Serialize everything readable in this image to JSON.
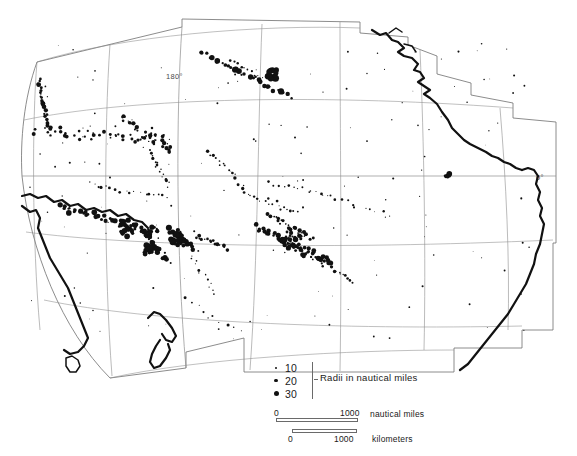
{
  "map": {
    "title": "Pacific Ocean islands map",
    "projection_note": "interrupted stepped graticule",
    "labels": [
      {
        "name": "meridian-180",
        "text": "180°",
        "x": 168,
        "y": 76
      },
      {
        "name": "equator-0",
        "text": "0°",
        "x": 536,
        "y": 178
      }
    ],
    "colors": {
      "land": "#111111",
      "graticule": "#8d8d8d",
      "border": "#6f6f6f",
      "background": "#ffffff"
    }
  },
  "legend": {
    "caption": "Radii in nautical miles",
    "items": [
      {
        "label": "10",
        "size_class": "d10"
      },
      {
        "label": "20",
        "size_class": "d20"
      },
      {
        "label": "30",
        "size_class": "d30"
      }
    ]
  },
  "scales": {
    "nautical": {
      "zero": "0",
      "max": "1000",
      "unit": "nautical miles"
    },
    "kilometers": {
      "zero": "0",
      "max": "1000",
      "unit": "kilometers"
    }
  },
  "chart_data": {
    "type": "scatter",
    "xlabel": "longitude",
    "ylabel": "latitude",
    "legend_position": "bottom-left",
    "size_legend": [
      10,
      20,
      30
    ],
    "size_units": "nautical miles",
    "clusters": [
      {
        "name": "Mariana Islands",
        "cx": 44,
        "cy": 95
      },
      {
        "name": "Caroline Islands",
        "cx": 95,
        "cy": 133
      },
      {
        "name": "Marshall Islands",
        "cx": 150,
        "cy": 128
      },
      {
        "name": "Hawaiian Islands",
        "cx": 270,
        "cy": 75
      },
      {
        "name": "New Guinea",
        "cx": 70,
        "cy": 215
      },
      {
        "name": "Solomon Islands",
        "cx": 120,
        "cy": 225
      },
      {
        "name": "Vanuatu",
        "cx": 150,
        "cy": 245
      },
      {
        "name": "Fiji",
        "cx": 175,
        "cy": 240
      },
      {
        "name": "Samoa-Tonga",
        "cx": 205,
        "cy": 245
      },
      {
        "name": "Society Islands",
        "cx": 280,
        "cy": 240
      },
      {
        "name": "Tuamotu Archipelago",
        "cx": 305,
        "cy": 243
      },
      {
        "name": "Galapagos",
        "cx": 450,
        "cy": 178
      }
    ]
  }
}
